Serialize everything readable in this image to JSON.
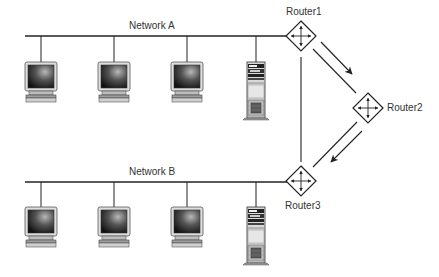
{
  "diagram": {
    "type": "network-routing",
    "networks": [
      {
        "id": "network-a",
        "label": "Network A",
        "bus_y": 36,
        "bus_x1": 25,
        "bus_x2": 287,
        "workstations": 3,
        "servers": 1
      },
      {
        "id": "network-b",
        "label": "Network B",
        "bus_y": 182,
        "bus_x1": 25,
        "bus_x2": 287,
        "workstations": 3,
        "servers": 1
      }
    ],
    "routers": [
      {
        "id": "router1",
        "label": "Router1",
        "cx": 301,
        "cy": 36
      },
      {
        "id": "router2",
        "label": "Router2",
        "cx": 368,
        "cy": 108
      },
      {
        "id": "router3",
        "label": "Router3",
        "cx": 301,
        "cy": 181
      }
    ],
    "links": [
      {
        "from": "router1",
        "to": "router3",
        "type": "line"
      },
      {
        "from": "router1",
        "to": "router2",
        "type": "line"
      },
      {
        "from": "router2",
        "to": "router3",
        "type": "line"
      }
    ],
    "flow_arrows": [
      {
        "from": "router1",
        "to": "router2",
        "label": ""
      },
      {
        "from": "router2",
        "to": "router3",
        "label": ""
      }
    ],
    "colors": {
      "line": "#222222",
      "screen_dark": "#1a1a1a",
      "screen_light": "#9a9a9a",
      "bezel": "#d6d6d6",
      "server_body": "#cfcfcf"
    }
  }
}
